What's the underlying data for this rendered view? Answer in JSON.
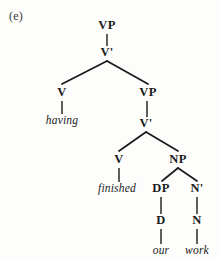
{
  "figure": {
    "example_label": "(e)",
    "caption": ""
  },
  "tree": {
    "type": "syntax-tree",
    "sentence": "having finished our work",
    "nodes": [
      {
        "id": "vp-top",
        "label": "VP",
        "kind": "nonterminal",
        "x": 107,
        "y": 29
      },
      {
        "id": "vbar-top",
        "label": "V'",
        "kind": "nonterminal",
        "x": 107,
        "y": 56
      },
      {
        "id": "v-1",
        "label": "V",
        "kind": "nonterminal",
        "x": 62,
        "y": 96
      },
      {
        "id": "having",
        "label": "having",
        "kind": "terminal",
        "x": 62,
        "y": 124
      },
      {
        "id": "vp-2",
        "label": "VP",
        "kind": "nonterminal",
        "x": 148,
        "y": 96
      },
      {
        "id": "vbar-2",
        "label": "V'",
        "kind": "nonterminal",
        "x": 146,
        "y": 127
      },
      {
        "id": "v-2",
        "label": "V",
        "kind": "nonterminal",
        "x": 119,
        "y": 163
      },
      {
        "id": "finished",
        "label": "finished",
        "kind": "terminal",
        "x": 117,
        "y": 192
      },
      {
        "id": "np",
        "label": "NP",
        "kind": "nonterminal",
        "x": 178,
        "y": 163
      },
      {
        "id": "dp",
        "label": "DP",
        "kind": "nonterminal",
        "x": 161,
        "y": 192
      },
      {
        "id": "nbar",
        "label": "N'",
        "kind": "nonterminal",
        "x": 197,
        "y": 192
      },
      {
        "id": "d",
        "label": "D",
        "kind": "nonterminal",
        "x": 161,
        "y": 224
      },
      {
        "id": "n",
        "label": "N",
        "kind": "nonterminal",
        "x": 197,
        "y": 224
      },
      {
        "id": "our",
        "label": "our",
        "kind": "terminal",
        "x": 161,
        "y": 254
      },
      {
        "id": "work",
        "label": "work",
        "kind": "terminal",
        "x": 197,
        "y": 254
      }
    ],
    "stems": [
      {
        "from": "vp-top",
        "to": "vbar-top",
        "x": 107,
        "y1": 34,
        "y2": 46
      },
      {
        "from": "v-1",
        "to": "having",
        "x": 62,
        "y1": 101,
        "y2": 114
      },
      {
        "from": "vp-2",
        "to": "vbar-2",
        "x": 147,
        "y1": 101,
        "y2": 117
      },
      {
        "from": "v-2",
        "to": "finished",
        "x": 119,
        "y1": 168,
        "y2": 182
      },
      {
        "from": "dp",
        "to": "d",
        "x": 161,
        "y1": 197,
        "y2": 214
      },
      {
        "from": "nbar",
        "to": "n",
        "x": 197,
        "y1": 197,
        "y2": 214
      },
      {
        "from": "d",
        "to": "our",
        "x": 161,
        "y1": 229,
        "y2": 244
      },
      {
        "from": "n",
        "to": "work",
        "x": 197,
        "y1": 229,
        "y2": 244
      }
    ],
    "branches": [
      {
        "parent": "vbar-top",
        "apex_x": 107,
        "apex_y": 61,
        "children": [
          {
            "to": "v-1",
            "x": 62,
            "y": 84
          },
          {
            "to": "vp-2",
            "x": 148,
            "y": 84
          }
        ]
      },
      {
        "parent": "vbar-2",
        "apex_x": 146,
        "apex_y": 132,
        "children": [
          {
            "to": "v-2",
            "x": 119,
            "y": 151
          },
          {
            "to": "np",
            "x": 178,
            "y": 151
          }
        ]
      },
      {
        "parent": "np",
        "apex_x": 178,
        "apex_y": 168,
        "children": [
          {
            "to": "dp",
            "x": 162,
            "y": 181
          },
          {
            "to": "nbar",
            "x": 197,
            "y": 181
          }
        ]
      }
    ]
  },
  "colors": {
    "ink": "#1a1a1a",
    "page": "#fdfdfc",
    "label": "#3a3a3a"
  }
}
